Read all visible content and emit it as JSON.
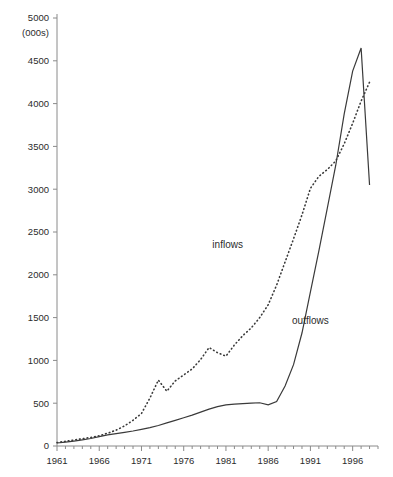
{
  "chart_data": {
    "type": "line",
    "title": "",
    "subtitle": "",
    "xlabel": "",
    "ylabel": "",
    "unit_label": "(000s)",
    "xlim": [
      1961,
      1999
    ],
    "ylim": [
      0,
      5000
    ],
    "ytick_step": 500,
    "xtick_step": 5,
    "grid": false,
    "legend_position": "inline-annotations",
    "yticks": [
      0,
      500,
      1000,
      1500,
      2000,
      2500,
      3000,
      3500,
      4000,
      4500,
      5000
    ],
    "ytick_labels": [
      "0",
      "500",
      "1000",
      "1500",
      "2000",
      "2500",
      "3000",
      "3500",
      "4000",
      "4500",
      "5000"
    ],
    "xticks": [
      1961,
      1966,
      1971,
      1976,
      1981,
      1986,
      1991,
      1996
    ],
    "xtick_labels": [
      "1961",
      "1966",
      "1971",
      "1976",
      "1981",
      "1986",
      "1991",
      "1996"
    ],
    "x": [
      1961,
      1962,
      1963,
      1964,
      1965,
      1966,
      1967,
      1968,
      1969,
      1970,
      1971,
      1972,
      1973,
      1974,
      1975,
      1976,
      1977,
      1978,
      1979,
      1980,
      1981,
      1982,
      1983,
      1984,
      1985,
      1986,
      1987,
      1988,
      1989,
      1990,
      1991,
      1992,
      1993,
      1994,
      1995,
      1996,
      1997,
      1998
    ],
    "series": [
      {
        "name": "inflows",
        "style": "dotted",
        "color": "#3a3a3a",
        "label": "inflows",
        "label_x": 1981.2,
        "label_y": 2310,
        "values": [
          40,
          55,
          70,
          85,
          100,
          120,
          150,
          185,
          235,
          300,
          380,
          560,
          770,
          640,
          760,
          830,
          900,
          1010,
          1150,
          1090,
          1050,
          1180,
          1290,
          1380,
          1500,
          1650,
          1880,
          2150,
          2420,
          2700,
          3010,
          3150,
          3230,
          3330,
          3530,
          3770,
          4030,
          4250
        ]
      },
      {
        "name": "outflows",
        "style": "solid",
        "color": "#3a3a3a",
        "label": "outflows",
        "label_x": 1991.0,
        "label_y": 1430,
        "values": [
          35,
          45,
          58,
          72,
          88,
          110,
          130,
          145,
          160,
          175,
          195,
          215,
          240,
          270,
          300,
          330,
          360,
          395,
          430,
          460,
          480,
          490,
          495,
          500,
          505,
          480,
          520,
          700,
          950,
          1320,
          1800,
          2280,
          2780,
          3280,
          3880,
          4380,
          4650,
          3050
        ]
      }
    ],
    "annotations": [
      {
        "text": "inflows",
        "x": 1981.2,
        "y": 2310
      },
      {
        "text": "outflows",
        "x": 1991.0,
        "y": 1430
      }
    ]
  },
  "colors": {
    "axis": "#8a8a8a",
    "ink": "#3a3a3a",
    "background": "#ffffff"
  }
}
